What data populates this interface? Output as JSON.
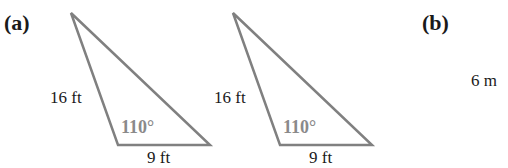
{
  "figure": {
    "parts": [
      {
        "label": "(a)"
      },
      {
        "label": "(b)"
      }
    ],
    "triangles": [
      {
        "side_left": "16 ft",
        "side_bottom": "9 ft",
        "angle": "110°"
      },
      {
        "side_left": "16 ft",
        "side_bottom": "9 ft",
        "angle": "110°"
      }
    ],
    "part_b_side": "6 m",
    "colors": {
      "stroke": "#808080",
      "text": "#1a1a1a",
      "angle_text": "#8a8a8a"
    }
  }
}
